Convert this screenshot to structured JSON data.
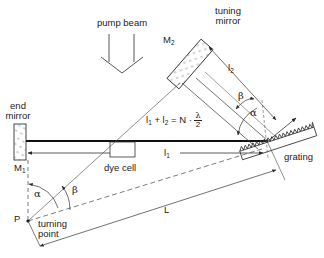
{
  "diagram": {
    "type": "littman-metcalf dye laser resonator (grazing incidence grating)",
    "labels": {
      "pump_beam": "pump beam",
      "tuning_mirror_1": "tuning",
      "tuning_mirror_2": "mirror",
      "m2": "M",
      "m2_sub": "2",
      "end_mirror_1": "end",
      "end_mirror_2": "mirror",
      "m1": "M",
      "m1_sub": "1",
      "dye_cell": "dye cell",
      "grating": "grating",
      "turning_point_1": "turning",
      "turning_point_2": "point",
      "p": "P",
      "l1": "l",
      "l1_sub": "1",
      "l2": "l",
      "l2_sub": "2",
      "big_l": "L",
      "alpha": "α",
      "beta": "β",
      "alpha_p": "α",
      "beta_p": "β"
    },
    "formula": {
      "lhs_l1": "l",
      "lhs_l1_sub": "1",
      "plus": " + ",
      "lhs_l2": "l",
      "lhs_l2_sub": "2",
      "eq": " = N · ",
      "frac_num": "λ",
      "frac_den": "2"
    },
    "colors": {
      "line": "#2a2a2a",
      "background": "#ffffff"
    }
  }
}
